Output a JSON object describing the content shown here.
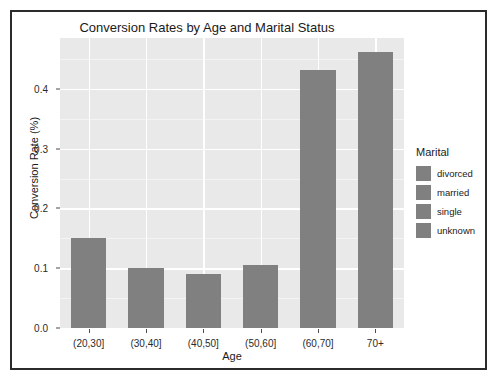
{
  "chart_data": {
    "type": "bar",
    "title": "Conversion Rates by Age and Marital Status",
    "xlabel": "Age",
    "ylabel": "Conversion Rate (%)",
    "categories": [
      "(20,30]",
      "(30,40]",
      "(40,50]",
      "(50,60]",
      "(60,70]",
      "70+"
    ],
    "values": [
      0.151,
      0.1,
      0.09,
      0.106,
      0.432,
      0.461
    ],
    "ylim": [
      0.0,
      0.485
    ],
    "ytick_labels": [
      "0.0",
      "0.1",
      "0.2",
      "0.3",
      "0.4"
    ],
    "ytick_values": [
      0.0,
      0.1,
      0.2,
      0.3,
      0.4
    ],
    "grid": true,
    "legend_position": "right",
    "legend": {
      "title": "Marital",
      "entries": [
        {
          "label": "divorced",
          "color": "#808080"
        },
        {
          "label": "married",
          "color": "#808080"
        },
        {
          "label": "single",
          "color": "#808080"
        },
        {
          "label": "unknown",
          "color": "#808080"
        }
      ]
    },
    "colors": {
      "bar_fill": "#808080",
      "panel_background": "#e9e9e9",
      "gridline": "#ffffff",
      "figure_background": "#ffffff",
      "frame_border": "#2b2b2b",
      "text": "#1a1a1a"
    }
  }
}
